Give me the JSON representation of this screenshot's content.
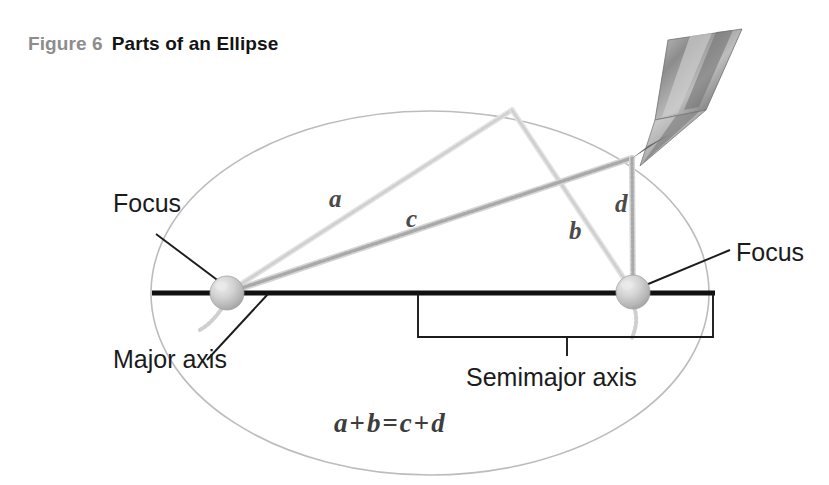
{
  "caption": {
    "figure_number": "Figure 6",
    "title": "Parts of an Ellipse"
  },
  "labels": {
    "focus_left": "Focus",
    "focus_right": "Focus",
    "major_axis": "Major axis",
    "semimajor_axis": "Semimajor axis"
  },
  "segments": {
    "a": "a",
    "b": "b",
    "c": "c",
    "d": "d"
  },
  "equation": {
    "lhs_1": "a",
    "plus_1": "+",
    "lhs_2": "b",
    "equals": "=",
    "rhs_1": "c",
    "plus_2": "+",
    "rhs_2": "d",
    "full": "a + b = c + d"
  },
  "colors": {
    "caption_number": "#8d8d8d",
    "caption_title": "#141414",
    "ellipse_outline": "#b8b8b8",
    "major_axis": "#111111",
    "string": "#c9c9c9",
    "pin": "#b9b9b9",
    "pencil": "#8a8a8a",
    "label_text": "#1b1b1b",
    "segment_label": "#4a4a4a",
    "background": "#ffffff"
  },
  "geometry": {
    "ellipse_center_x": 430,
    "ellipse_center_y": 293,
    "ellipse_rx": 279,
    "ellipse_ry": 182,
    "focus_left_x": 227,
    "focus_left_y": 293,
    "focus_right_x": 633,
    "focus_right_y": 292,
    "pin_radius": 17,
    "pencil_tip_x": 632,
    "pencil_tip_y": 158,
    "string_apex_x": 512,
    "string_apex_y": 110,
    "major_axis_x1": 152,
    "major_axis_x2": 715,
    "major_axis_y": 293,
    "semimajor_bracket_left_x": 418,
    "semimajor_bracket_right_x": 713,
    "semimajor_bracket_top_y": 293,
    "semimajor_bracket_bottom_y": 337,
    "semimajor_tick_x": 567,
    "semimajor_tick_y": 356
  },
  "icons": {
    "pencil": "pencil-icon",
    "pin_left": "pin-icon",
    "pin_right": "pin-icon"
  }
}
